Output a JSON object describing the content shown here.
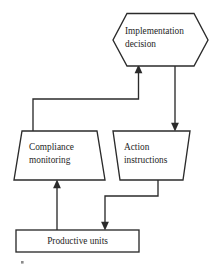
{
  "diagram": {
    "background_color": "#ffffff",
    "stroke_color": "#2b2b2b",
    "text_color": "#1e1e1e",
    "nodes": [
      {
        "id": "implementation-decision",
        "shape": "hexagon",
        "label_line1": "Implementation",
        "label_line2": "decision"
      },
      {
        "id": "compliance-monitoring",
        "shape": "trapezoid",
        "label_line1": "Compliance",
        "label_line2": "monitoring"
      },
      {
        "id": "action-instructions",
        "shape": "trapezoid",
        "label_line1": "Action",
        "label_line2": "instructions"
      },
      {
        "id": "productive-units",
        "shape": "rectangle",
        "label_line1": "Productive units"
      }
    ],
    "edges": [
      {
        "id": "compliance-to-decision",
        "from": "compliance-monitoring",
        "to": "implementation-decision",
        "routing": "elbow"
      },
      {
        "id": "decision-to-action",
        "from": "implementation-decision",
        "to": "action-instructions",
        "routing": "straight"
      },
      {
        "id": "action-to-productive",
        "from": "action-instructions",
        "to": "productive-units",
        "routing": "elbow"
      },
      {
        "id": "productive-to-compliance",
        "from": "productive-units",
        "to": "compliance-monitoring",
        "routing": "straight"
      }
    ]
  }
}
